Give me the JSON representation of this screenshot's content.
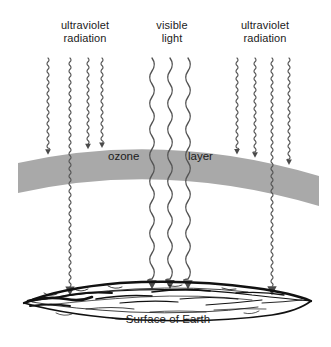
{
  "diagram": {
    "labels": {
      "uv_left_line1": "ultraviolet",
      "uv_left_line2": "radiation",
      "visible_line1": "visible",
      "visible_line2": "light",
      "uv_right_line1": "ultraviolet",
      "uv_right_line2": "radiation",
      "ozone": "ozone",
      "layer": "layer",
      "surface": "Surface of Earth"
    },
    "colors": {
      "background": "#ffffff",
      "ozone_band": "#aaaaaa",
      "ray": "#555555",
      "arrow": "#4a4a4a",
      "earth_line": "#111111",
      "text": "#1b1b1b"
    },
    "ray_groups": [
      {
        "name": "ultraviolet-left",
        "kind": "ultraviolet",
        "wavelength": "short",
        "count": 4,
        "rays": [
          {
            "x": 48,
            "blocked": true
          },
          {
            "x": 70,
            "blocked": false
          },
          {
            "x": 88,
            "blocked": true
          },
          {
            "x": 102,
            "blocked": true
          }
        ]
      },
      {
        "name": "visible-light",
        "kind": "visible",
        "wavelength": "long",
        "count": 3,
        "rays": [
          {
            "x": 152,
            "blocked": false
          },
          {
            "x": 170,
            "blocked": false
          },
          {
            "x": 188,
            "blocked": false
          }
        ]
      },
      {
        "name": "ultraviolet-right",
        "kind": "ultraviolet",
        "wavelength": "short",
        "count": 4,
        "rays": [
          {
            "x": 237,
            "blocked": true
          },
          {
            "x": 255,
            "blocked": true
          },
          {
            "x": 272,
            "blocked": false
          },
          {
            "x": 289,
            "blocked": true
          }
        ]
      }
    ],
    "ozone_band": {
      "left_x": 18,
      "right_x": 319,
      "thickness": 30,
      "arc_peak_y": 146
    },
    "earth": {
      "left_x": 22,
      "right_x": 312,
      "center_y": 300
    }
  }
}
